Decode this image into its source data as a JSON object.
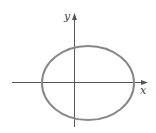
{
  "diagram": {
    "type": "coordinate-plane-ellipse",
    "axes": {
      "x_label": "x",
      "y_label": "y",
      "color": "#555555"
    },
    "ellipse": {
      "stroke_color": "#888888",
      "center": [
        88,
        83
      ],
      "rx": 46,
      "ry": 37
    }
  }
}
